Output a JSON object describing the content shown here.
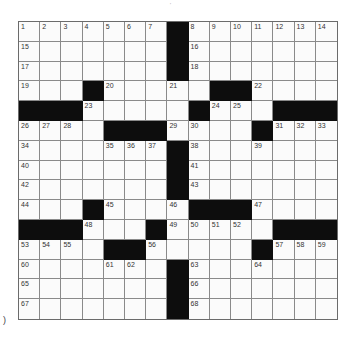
{
  "puzzle": {
    "rows": 15,
    "cols": 15,
    "layout": [
      "1234567#8901234",
      "a......#b......",
      "c......#d......",
      "e..#f..g.##h...",
      "###i....#jk.###",
      "lmn.###op..#qrs",
      "t...uvw#x..y...",
      "z......#A......",
      "B......#C......",
      "D..#E..F###G...",
      "###H..#IJKL.###",
      "MNO.##P....#QRS",
      "T...UV.#W..X...",
      "Y......#Z......",
      "$......#%......"
    ],
    "grid": [
      [
        1,
        2,
        3,
        4,
        5,
        6,
        7,
        "#",
        8,
        9,
        10,
        11,
        12,
        13,
        14
      ],
      [
        15,
        0,
        0,
        0,
        0,
        0,
        0,
        "#",
        16,
        0,
        0,
        0,
        0,
        0,
        0
      ],
      [
        17,
        0,
        0,
        0,
        0,
        0,
        0,
        "#",
        18,
        0,
        0,
        0,
        0,
        0,
        0
      ],
      [
        19,
        0,
        0,
        "#",
        20,
        0,
        0,
        21,
        0,
        "#",
        "#",
        22,
        0,
        0,
        0
      ],
      [
        "#",
        "#",
        "#",
        23,
        0,
        0,
        0,
        0,
        "#",
        24,
        25,
        0,
        "#",
        "#",
        "#"
      ],
      [
        26,
        27,
        28,
        0,
        "#",
        "#",
        "#",
        29,
        30,
        0,
        0,
        "#",
        31,
        32,
        33
      ],
      [
        34,
        0,
        0,
        0,
        35,
        36,
        37,
        "#",
        38,
        0,
        0,
        39,
        0,
        0,
        0
      ],
      [
        40,
        0,
        0,
        0,
        0,
        0,
        0,
        "#",
        41,
        0,
        0,
        0,
        0,
        0,
        0
      ],
      [
        42,
        0,
        0,
        0,
        0,
        0,
        0,
        "#",
        43,
        0,
        0,
        0,
        0,
        0,
        0
      ],
      [
        44,
        0,
        0,
        "#",
        45,
        0,
        0,
        46,
        "#",
        "#",
        "#",
        47,
        0,
        0,
        0
      ],
      [
        "#",
        "#",
        "#",
        48,
        0,
        0,
        "#",
        49,
        50,
        51,
        52,
        0,
        "#",
        "#",
        "#"
      ],
      [
        53,
        54,
        55,
        0,
        "#",
        "#",
        56,
        0,
        0,
        0,
        0,
        "#",
        57,
        58,
        59
      ],
      [
        60,
        0,
        0,
        0,
        61,
        62,
        0,
        "#",
        63,
        0,
        0,
        64,
        0,
        0,
        0
      ],
      [
        65,
        0,
        0,
        0,
        0,
        0,
        0,
        "#",
        66,
        0,
        0,
        0,
        0,
        0,
        0
      ],
      [
        67,
        0,
        0,
        0,
        0,
        0,
        0,
        "#",
        68,
        0,
        0,
        0,
        0,
        0,
        0
      ]
    ]
  },
  "marks": {
    "top": "'",
    "left": ")"
  }
}
